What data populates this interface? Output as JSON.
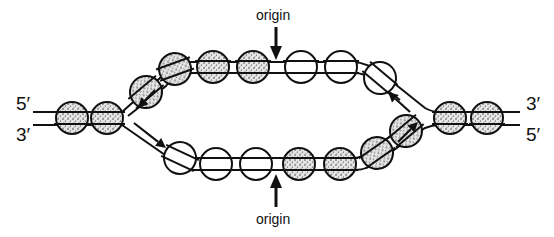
{
  "labels": {
    "left_top": "5′",
    "left_bottom": "3′",
    "right_top": "3′",
    "right_bottom": "5′",
    "origin_top": "origin",
    "origin_bottom": "origin"
  },
  "legend": {
    "stippled": "old (parental) histone octamer",
    "open": "new histone octamer"
  },
  "colors": {
    "ink": "#111111",
    "background": "#ffffff"
  },
  "nucleosomes": {
    "left_duplex": [
      {
        "cx": 72,
        "cy": 118,
        "type": "stippled"
      },
      {
        "cx": 107,
        "cy": 118,
        "type": "stippled"
      }
    ],
    "top_arm": [
      {
        "cx": 146,
        "cy": 92,
        "type": "stippled",
        "angle": -40
      },
      {
        "cx": 175,
        "cy": 69,
        "type": "stippled",
        "angle": -20
      },
      {
        "cx": 213,
        "cy": 67,
        "type": "stippled",
        "angle": 0
      },
      {
        "cx": 253,
        "cy": 67,
        "type": "stippled",
        "angle": 0
      },
      {
        "cx": 301,
        "cy": 67,
        "type": "open",
        "angle": 0
      },
      {
        "cx": 341,
        "cy": 67,
        "type": "open",
        "angle": 0
      },
      {
        "cx": 380,
        "cy": 78,
        "type": "open",
        "angle": 40
      }
    ],
    "bottom_arm": [
      {
        "cx": 180,
        "cy": 158,
        "type": "open",
        "angle": 25
      },
      {
        "cx": 216,
        "cy": 164,
        "type": "open",
        "angle": 0
      },
      {
        "cx": 256,
        "cy": 164,
        "type": "open",
        "angle": 0
      },
      {
        "cx": 299,
        "cy": 164,
        "type": "stippled",
        "angle": 0
      },
      {
        "cx": 340,
        "cy": 164,
        "type": "stippled",
        "angle": 0
      },
      {
        "cx": 377,
        "cy": 153,
        "type": "stippled",
        "angle": -35
      },
      {
        "cx": 406,
        "cy": 131,
        "type": "stippled",
        "angle": -40
      }
    ],
    "right_duplex": [
      {
        "cx": 450,
        "cy": 118,
        "type": "stippled"
      },
      {
        "cx": 487,
        "cy": 118,
        "type": "stippled"
      }
    ]
  },
  "fork_arrows": [
    {
      "name": "left-fork-arrow-upper",
      "x1": 155,
      "y1": 90,
      "x2": 138,
      "y2": 108
    },
    {
      "name": "left-fork-arrow-lower",
      "x1": 134,
      "y1": 123,
      "x2": 166,
      "y2": 148
    },
    {
      "name": "right-fork-arrow-upper",
      "x1": 410,
      "y1": 112,
      "x2": 388,
      "y2": 92
    },
    {
      "name": "right-fork-arrow-lower",
      "x1": 398,
      "y1": 142,
      "x2": 418,
      "y2": 122
    }
  ]
}
